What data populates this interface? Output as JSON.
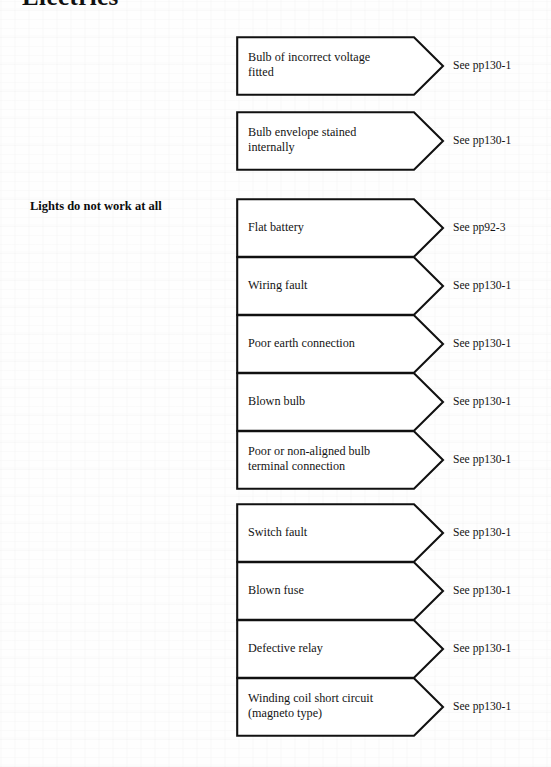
{
  "page": {
    "title": "Electrics",
    "branch_label": "Lights do not work at all",
    "background_color": "#fefefe",
    "line_color": "#111111",
    "text_color": "#141414"
  },
  "causes": [
    {
      "id": "bulb-incorrect-voltage",
      "text": "Bulb of incorrect voltage\nfitted",
      "reference": "See pp130-1",
      "top": 36,
      "group_gap_after": false
    },
    {
      "id": "bulb-envelope-stained",
      "text": "Bulb envelope stained\ninternally",
      "reference": "See pp130-1",
      "top": 111,
      "group_gap_after": true
    },
    {
      "id": "flat-battery",
      "text": "Flat battery",
      "reference": "See pp92-3",
      "top": 198,
      "group_gap_after": false
    },
    {
      "id": "wiring-fault",
      "text": "Wiring fault",
      "reference": "See pp130-1",
      "top": 256,
      "group_gap_after": false
    },
    {
      "id": "poor-earth-connection",
      "text": "Poor earth connection",
      "reference": "See pp130-1",
      "top": 314,
      "group_gap_after": false
    },
    {
      "id": "blown-bulb",
      "text": "Blown bulb",
      "reference": "See pp130-1",
      "top": 372,
      "group_gap_after": false
    },
    {
      "id": "poor-or-non-aligned-bulb-terminal",
      "text": "Poor or non-aligned bulb\nterminal connection",
      "reference": "See pp130-1",
      "top": 430,
      "group_gap_after": false
    },
    {
      "id": "switch-fault",
      "text": "Switch fault",
      "reference": "See pp130-1",
      "top": 503,
      "group_gap_after": false
    },
    {
      "id": "blown-fuse",
      "text": "Blown fuse",
      "reference": "See pp130-1",
      "top": 561,
      "group_gap_after": false
    },
    {
      "id": "defective-relay",
      "text": "Defective relay",
      "reference": "See pp130-1",
      "top": 619,
      "group_gap_after": false
    },
    {
      "id": "winding-coil-short-circuit",
      "text": "Winding coil short circuit\n(magneto type)",
      "reference": "See pp130-1",
      "top": 677,
      "group_gap_after": false
    }
  ]
}
